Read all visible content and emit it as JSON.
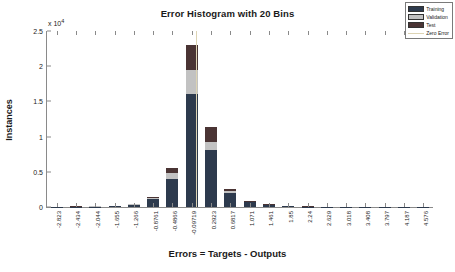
{
  "chart_data": {
    "type": "bar",
    "title": "Error Histogram with 20 Bins",
    "xlabel": "Errors = Targets - Outputs",
    "ylabel": "Instances",
    "y_exponent_label": "x 10",
    "y_exponent_power": "4",
    "y_multiplier": 10000,
    "ylim": [
      0,
      25000
    ],
    "yticks": [
      0,
      0.5,
      1,
      1.5,
      2,
      2.5
    ],
    "ytick_labels": [
      "0",
      "0.5",
      "1",
      "1.5",
      "2",
      "2.5"
    ],
    "grid": false,
    "stacked": true,
    "legend_position": "top-right",
    "categories": [
      "-2.823",
      "-2.434",
      "-2.044",
      "-1.655",
      "-1.266",
      "-0.8761",
      "-0.4866",
      "-0.09719",
      "0.2923",
      "0.6817",
      "1.071",
      "1.461",
      "1.85",
      "2.24",
      "2.629",
      "3.018",
      "3.408",
      "3.797",
      "4.187",
      "4.576"
    ],
    "series": [
      {
        "name": "Training",
        "color": "#2d3a4d",
        "values": [
          20,
          60,
          70,
          130,
          330,
          1100,
          4000,
          16100,
          8050,
          1950,
          700,
          300,
          130,
          60,
          50,
          40,
          40,
          30,
          25,
          20
        ]
      },
      {
        "name": "Validation",
        "color": "#c2c2c2",
        "values": [
          5,
          12,
          15,
          28,
          70,
          130,
          800,
          3400,
          1250,
          300,
          80,
          35,
          15,
          8,
          6,
          5,
          5,
          4,
          3,
          3
        ]
      },
      {
        "name": "Test",
        "color": "#4a3434",
        "values": [
          5,
          13,
          15,
          27,
          70,
          170,
          800,
          3500,
          2100,
          350,
          90,
          40,
          20,
          10,
          8,
          7,
          6,
          5,
          4,
          4
        ]
      }
    ],
    "zero_error": {
      "label": "Zero Error",
      "color": "#ddd4b4",
      "bin_index": 7,
      "position_fraction": 0.386
    },
    "legend_entries": [
      {
        "label": "Training",
        "type": "swatch",
        "color": "#2d3a4d"
      },
      {
        "label": "Validation",
        "type": "swatch",
        "color": "#c2c2c2"
      },
      {
        "label": "Test",
        "type": "swatch",
        "color": "#4a3434"
      },
      {
        "label": "Zero Error",
        "type": "line",
        "color": "#ddd4b4"
      }
    ]
  }
}
